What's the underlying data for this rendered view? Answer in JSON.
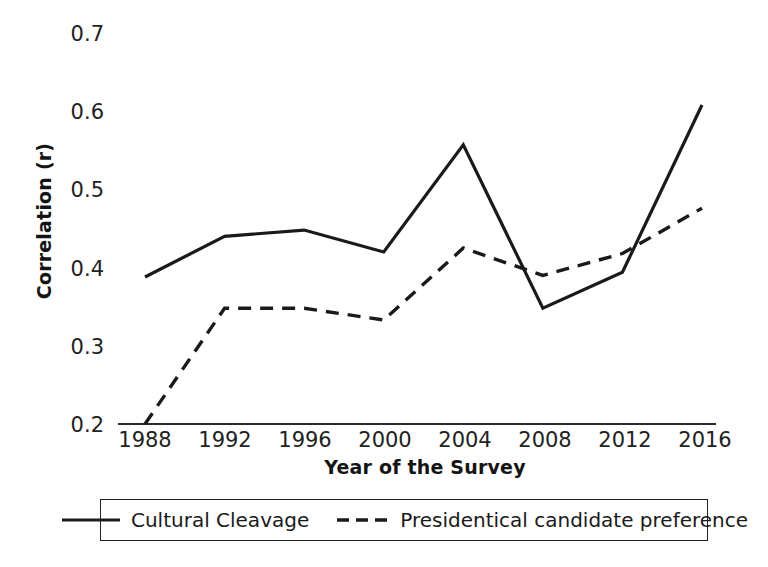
{
  "chart_data": {
    "type": "line",
    "title": "",
    "xlabel": "Year of the Survey",
    "ylabel": "Correlation (r)",
    "categories": [
      "1988",
      "1992",
      "1996",
      "2000",
      "2004",
      "2008",
      "2012",
      "2016"
    ],
    "x": [
      1988,
      1992,
      1996,
      2000,
      2004,
      2008,
      2012,
      2016
    ],
    "ylim": [
      0.2,
      0.7
    ],
    "yticks": [
      "0.2",
      "0.3",
      "0.4",
      "0.5",
      "0.6",
      "0.7"
    ],
    "ytick_values": [
      0.2,
      0.3,
      0.4,
      0.5,
      0.6,
      0.7
    ],
    "grid": false,
    "legend_position": "bottom",
    "series": [
      {
        "name": "Cultural Cleavage",
        "style": "solid",
        "color": "#1a1a1a",
        "values": [
          0.388,
          0.44,
          0.448,
          0.42,
          0.557,
          0.348,
          0.394,
          0.608
        ]
      },
      {
        "name": "Presidentical candidate preference",
        "style": "dashed",
        "color": "#1a1a1a",
        "values": [
          0.2,
          0.348,
          0.348,
          0.333,
          0.425,
          0.39,
          0.418,
          0.476
        ]
      }
    ]
  },
  "axis": {
    "ytick_0": "0.7",
    "ytick_1": "0.6",
    "ytick_2": "0.5",
    "ytick_3": "0.4",
    "ytick_4": "0.3",
    "ytick_5": "0.2",
    "xtick_0": "1988",
    "xtick_1": "1992",
    "xtick_2": "1996",
    "xtick_3": "2000",
    "xtick_4": "2004",
    "xtick_5": "2008",
    "xtick_6": "2012",
    "xtick_7": "2016",
    "x_axis_title": "Year of the Survey",
    "y_axis_title": "Correlation (r)"
  },
  "legend": {
    "entries": [
      {
        "label": "Cultural Cleavage",
        "style": "solid"
      },
      {
        "label": "Presidentical candidate preference",
        "style": "dashed"
      }
    ],
    "entry_0_label": "Cultural Cleavage",
    "entry_1_label": "Presidentical candidate preference"
  }
}
